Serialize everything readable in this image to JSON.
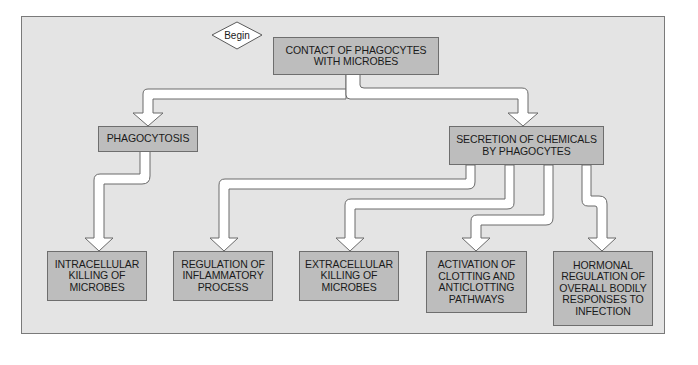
{
  "diagram": {
    "type": "flowchart",
    "start": {
      "label": "Begin",
      "shape": "diamond"
    },
    "nodes": {
      "contact": "CONTACT OF PHAGOCYTES\nWITH MICROBES",
      "phagocytosis": "PHAGOCYTOSIS",
      "secretion": "SECRETION OF CHEMICALS\nBY PHAGOCYTES",
      "intracellular": "INTRACELLULAR\nKILLING OF\nMICROBES",
      "regulation": "REGULATION OF\nINFLAMMATORY\nPROCESS",
      "extracellular": "EXTRACELLULAR\nKILLING OF\nMICROBES",
      "activation": "ACTIVATION OF\nCLOTTING AND\nANTICLOTTING\nPATHWAYS",
      "hormonal": "HORMONAL\nREGULATION OF\nOVERALL BODILY\nRESPONSES TO\nINFECTION"
    },
    "edges": [
      {
        "from": "contact",
        "to": "phagocytosis"
      },
      {
        "from": "contact",
        "to": "secretion"
      },
      {
        "from": "phagocytosis",
        "to": "intracellular"
      },
      {
        "from": "secretion",
        "to": "regulation"
      },
      {
        "from": "secretion",
        "to": "extracellular"
      },
      {
        "from": "secretion",
        "to": "activation"
      },
      {
        "from": "secretion",
        "to": "hormonal"
      }
    ],
    "colors": {
      "panel": "#e4e4e4",
      "box": "#bdbdbd",
      "arrow_fill": "#ffffff",
      "outline": "#6e6e6e"
    }
  }
}
